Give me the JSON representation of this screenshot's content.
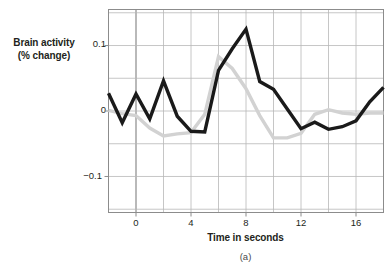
{
  "figure": {
    "caption": "(a)",
    "ylabel_line1": "Brain activity",
    "ylabel_line2": "(% change)",
    "xlabel": "Time in seconds"
  },
  "axis": {
    "yticks": [
      "0.1",
      "0",
      "−0.1"
    ],
    "xticks": [
      "0",
      "4",
      "8",
      "12",
      "16"
    ]
  },
  "colors": {
    "series_dark": "#1a1a1a",
    "series_light": "#d2d2d2",
    "grid": "#b8b8b8",
    "axis": "#8c8c8c",
    "zero_axis": "#8a8a8a",
    "text": "#231f20",
    "background": "#ffffff"
  },
  "chart_data": {
    "type": "line",
    "title": "",
    "xlabel": "Time in seconds",
    "ylabel": "Brain activity (% change)",
    "xlim": [
      -2,
      18
    ],
    "ylim": [
      -0.155,
      0.155
    ],
    "xticks": [
      0,
      4,
      8,
      12,
      16
    ],
    "yticks": [
      -0.1,
      0,
      0.1
    ],
    "grid": true,
    "legend": "none",
    "x": [
      -2,
      -1,
      0,
      1,
      2,
      3,
      4,
      5,
      6,
      7,
      8,
      9,
      10,
      11,
      12,
      13,
      14,
      15,
      16,
      17,
      18
    ],
    "series": [
      {
        "name": "dark",
        "color": "#1a1a1a",
        "values": [
          0.027,
          -0.018,
          0.026,
          -0.012,
          0.046,
          -0.008,
          -0.031,
          -0.032,
          0.062,
          0.095,
          0.125,
          0.045,
          0.033,
          0.003,
          -0.027,
          -0.017,
          -0.028,
          -0.024,
          -0.015,
          0.014,
          0.036
        ]
      },
      {
        "name": "light",
        "color": "#d2d2d2",
        "values": [
          0.001,
          -0.004,
          -0.007,
          -0.026,
          -0.038,
          -0.035,
          -0.033,
          -0.005,
          0.083,
          0.065,
          0.034,
          -0.007,
          -0.041,
          -0.041,
          -0.034,
          -0.005,
          0.002,
          -0.003,
          -0.005,
          -0.003,
          -0.003
        ]
      }
    ]
  }
}
